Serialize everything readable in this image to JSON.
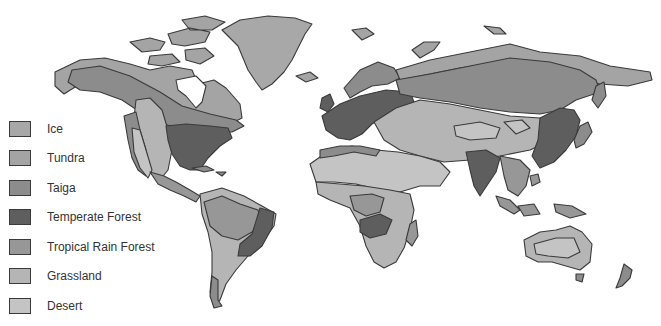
{
  "map": {
    "title": "World Biomes",
    "colors": {
      "ice": "#a8a8a8",
      "tundra": "#a4a4a4",
      "taiga": "#8c8c8c",
      "temperate_forest": "#5e5e5e",
      "tropical_rain_forest": "#979797",
      "grassland": "#b5b5b5",
      "desert": "#c4c4c4",
      "outline": "#3a3a3a",
      "ocean": "#ffffff"
    }
  },
  "legend": {
    "items": [
      {
        "key": "ice",
        "label": "Ice",
        "color": "#a8a8a8"
      },
      {
        "key": "tundra",
        "label": "Tundra",
        "color": "#a4a4a4"
      },
      {
        "key": "taiga",
        "label": "Taiga",
        "color": "#8c8c8c"
      },
      {
        "key": "temperate_forest",
        "label": "Temperate Forest",
        "color": "#5e5e5e"
      },
      {
        "key": "tropical_rain_forest",
        "label": "Tropical Rain Forest",
        "color": "#979797"
      },
      {
        "key": "grassland",
        "label": "Grassland",
        "color": "#b5b5b5"
      },
      {
        "key": "desert",
        "label": "Desert",
        "color": "#c4c4c4"
      }
    ]
  }
}
